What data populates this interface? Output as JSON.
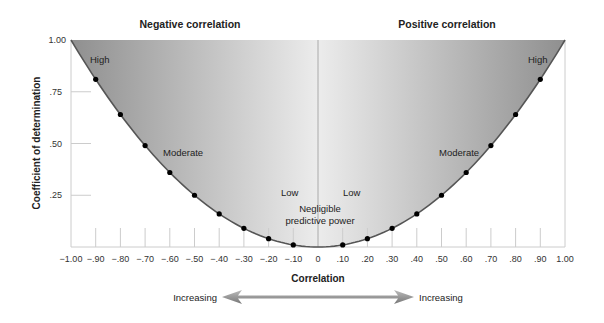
{
  "chart_data": {
    "type": "line",
    "title_left": "Negative correlation",
    "title_right": "Positive correlation",
    "xlabel": "Correlation",
    "ylabel": "Coefficient of determination",
    "xlim": [
      -1.0,
      1.0
    ],
    "ylim": [
      0,
      1.0
    ],
    "grid": false,
    "x_tick_labels": [
      "−1.00",
      "−.90",
      "−.80",
      "−.70",
      "−.60",
      "−.50",
      "−.40",
      "−.30",
      "−.20",
      "−.10",
      "0",
      ".10",
      ".20",
      ".30",
      ".40",
      ".50",
      ".60",
      ".70",
      ".80",
      ".90",
      "1.00"
    ],
    "y_tick_labels": [
      "1.00",
      ".75",
      ".50",
      ".25"
    ],
    "y_ticks": [
      1.0,
      0.75,
      0.5,
      0.25
    ],
    "series": [
      {
        "name": "r squared",
        "x": [
          -0.9,
          -0.8,
          -0.7,
          -0.6,
          -0.5,
          -0.4,
          -0.3,
          -0.2,
          -0.1,
          0.1,
          0.2,
          0.3,
          0.4,
          0.5,
          0.6,
          0.7,
          0.8,
          0.9
        ],
        "values": [
          0.81,
          0.64,
          0.49,
          0.36,
          0.25,
          0.16,
          0.09,
          0.04,
          0.01,
          0.01,
          0.04,
          0.09,
          0.16,
          0.25,
          0.36,
          0.49,
          0.64,
          0.81
        ]
      }
    ],
    "annotations": {
      "high_left": "High",
      "high_right": "High",
      "moderate_left": "Moderate",
      "moderate_right": "Moderate",
      "low_left": "Low",
      "low_right": "Low",
      "negligible_line1": "Negligible",
      "negligible_line2": "predictive power"
    },
    "arrow": {
      "left_label": "Increasing",
      "right_label": "Increasing"
    },
    "colors": {
      "fill_dark": "#9a9a9a",
      "fill_light": "#eeeeee",
      "curve": "#555555",
      "points": "#000000"
    }
  }
}
